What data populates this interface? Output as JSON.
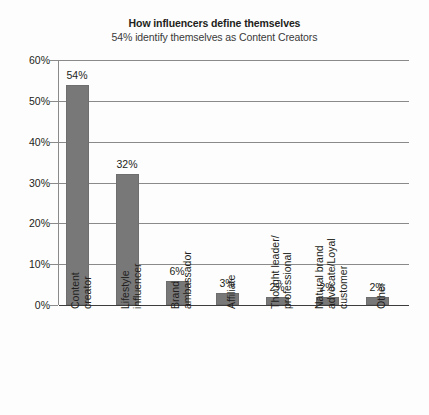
{
  "chart_data": {
    "type": "bar",
    "title": "How influencers define themselves",
    "subtitle": "54% identify themselves as Content Creators",
    "xlabel": "",
    "ylabel": "",
    "ylim": [
      0,
      60
    ],
    "ytick_labels": [
      "0%",
      "10%",
      "20%",
      "30%",
      "40%",
      "50%",
      "60%"
    ],
    "ytick_values": [
      0,
      10,
      20,
      30,
      40,
      50,
      60
    ],
    "grid": true,
    "legend": "none",
    "categories": [
      "Content creator",
      "Lifestyle influencer",
      "Brand ambassador",
      "Affiliate",
      "Thought leader/ professional",
      "Natural brand advocate/Loyal customer",
      "Other"
    ],
    "category_lines": [
      [
        "Content",
        "creator"
      ],
      [
        "Lifestyle",
        "influencer"
      ],
      [
        "Brand",
        "ambassador"
      ],
      [
        "Affiliate"
      ],
      [
        "Thought leader/",
        "professional"
      ],
      [
        "Natural brand",
        "advocate/Loyal",
        "customer"
      ],
      [
        "Other"
      ]
    ],
    "values": [
      54,
      32,
      6,
      3,
      2,
      2,
      2
    ],
    "value_labels": [
      "54%",
      "32%",
      "6%",
      "3%",
      "2%",
      "2%",
      "2%"
    ],
    "bar_color": "#787878",
    "grid_color": "#8a8a8a",
    "axis_color": "#3d3d3d",
    "background": "#fdfdfd"
  }
}
